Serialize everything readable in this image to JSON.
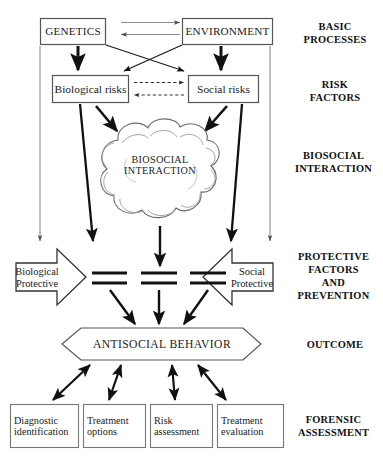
{
  "figure": {
    "nodes": {
      "genetics": "GENETICS",
      "environment": "ENVIRONMENT",
      "biological_risks": "Biological risks",
      "social_risks": "Social risks",
      "biosocial_interaction_line1": "BIOSOCIAL",
      "biosocial_interaction_line2": "INTERACTION",
      "biological_protective_line1": "Biological",
      "biological_protective_line2": "Protective",
      "social_protective_line1": "Social",
      "social_protective_line2": "Protective",
      "antisocial_behavior": "ANTISOCIAL BEHAVIOR"
    },
    "assessment_boxes": [
      {
        "line1": "Diagnostic",
        "line2": "identification"
      },
      {
        "line1": "Treatment",
        "line2": "options"
      },
      {
        "line1": "Risk",
        "line2": "assessment"
      },
      {
        "line1": "Treatment",
        "line2": "evaluation"
      }
    ],
    "stage_labels": [
      {
        "line1": "BASIC",
        "line2": "PROCESSES",
        "line3": "",
        "line4": ""
      },
      {
        "line1": "RISK",
        "line2": "FACTORS",
        "line3": "",
        "line4": ""
      },
      {
        "line1": "BIOSOCIAL",
        "line2": "INTERACTION",
        "line3": "",
        "line4": ""
      },
      {
        "line1": "PROTECTIVE",
        "line2": "FACTORS",
        "line3": "AND",
        "line4": "PREVENTION"
      },
      {
        "line1": "OUTCOME",
        "line2": "",
        "line3": "",
        "line4": ""
      },
      {
        "line1": "FORENSIC",
        "line2": "ASSESSMENT",
        "line3": "",
        "line4": ""
      }
    ],
    "colors": {
      "stroke_dark": "#111111",
      "stroke_mid": "#555555",
      "stroke_light": "#8a8a8a",
      "background": "#ffffff",
      "text": "#1a1a1a"
    }
  }
}
